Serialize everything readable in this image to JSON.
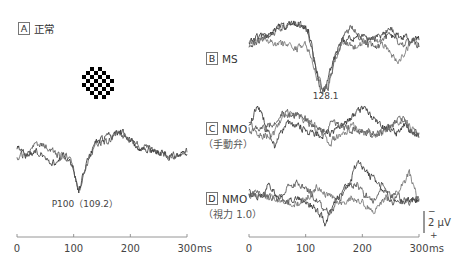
{
  "figure": {
    "panels": {
      "A": {
        "letter": "A",
        "title": "正常"
      },
      "B": {
        "letter": "B",
        "title": "MS"
      },
      "C": {
        "letter": "C",
        "title": "NMO",
        "subtitle": "（手動弁）"
      },
      "D": {
        "letter": "D",
        "title": "NMO",
        "subtitle": "（視力 1.0）"
      }
    },
    "stimulus": {
      "icon": "checkerboard-icon"
    },
    "scale_bar": {
      "label": "2 μV",
      "top_sign": "−",
      "bottom_sign": "+",
      "amplitude_uv": 2,
      "polarity": "negative-up"
    }
  },
  "chart_data": [
    {
      "panel": "A",
      "type": "line",
      "title": "正常",
      "xunit": "ms",
      "xlim": [
        0,
        300
      ],
      "xticks": [
        0,
        100,
        200,
        300
      ],
      "yunit": "μV",
      "annotations": [
        {
          "text": "P100（109.2）",
          "x_ms": 109.2
        }
      ],
      "series": [
        {
          "name": "trace 1",
          "points": [
            [
              0,
              -0.4
            ],
            [
              15,
              0.3
            ],
            [
              30,
              0.0
            ],
            [
              50,
              0.4
            ],
            [
              68,
              1.2
            ],
            [
              80,
              0.3
            ],
            [
              92,
              0.4
            ],
            [
              100,
              1.8
            ],
            [
              109,
              3.9
            ],
            [
              122,
              1.2
            ],
            [
              138,
              -0.9
            ],
            [
              160,
              -1.4
            ],
            [
              183,
              -1.9
            ],
            [
              198,
              -1.4
            ],
            [
              212,
              -0.4
            ],
            [
              232,
              -0.3
            ],
            [
              258,
              0.1
            ],
            [
              280,
              0.5
            ],
            [
              300,
              0.2
            ]
          ]
        },
        {
          "name": "trace 2",
          "points": [
            [
              0,
              0.5
            ],
            [
              15,
              0.2
            ],
            [
              30,
              -0.4
            ],
            [
              44,
              -0.8
            ],
            [
              60,
              -0.1
            ],
            [
              76,
              0.3
            ],
            [
              92,
              0.3
            ],
            [
              100,
              1.7
            ],
            [
              110,
              3.8
            ],
            [
              123,
              1.1
            ],
            [
              140,
              -0.8
            ],
            [
              162,
              -1.1
            ],
            [
              180,
              -1.8
            ],
            [
              200,
              -1.2
            ],
            [
              220,
              -0.5
            ],
            [
              240,
              -0.2
            ],
            [
              262,
              0.4
            ],
            [
              282,
              0.2
            ],
            [
              300,
              0.0
            ]
          ]
        }
      ]
    },
    {
      "panel": "B",
      "type": "line",
      "title": "MS",
      "xunit": "ms",
      "xlim": [
        0,
        300
      ],
      "xticks": [
        0,
        100,
        200,
        300
      ],
      "yunit": "μV",
      "annotations": [
        {
          "text": "128.1",
          "x_ms": 128.1
        }
      ],
      "series": [
        {
          "name": "trace 1",
          "points": [
            [
              0,
              0.0
            ],
            [
              25,
              -0.6
            ],
            [
              50,
              -1.4
            ],
            [
              70,
              -1.6
            ],
            [
              90,
              -1.7
            ],
            [
              105,
              -1.2
            ],
            [
              115,
              1.5
            ],
            [
              125,
              4.4
            ],
            [
              135,
              4.6
            ],
            [
              145,
              2.5
            ],
            [
              160,
              0.2
            ],
            [
              175,
              -0.3
            ],
            [
              195,
              -0.5
            ],
            [
              215,
              -0.2
            ],
            [
              235,
              -0.5
            ],
            [
              255,
              -0.6
            ],
            [
              275,
              -0.5
            ],
            [
              290,
              -0.2
            ],
            [
              300,
              -0.3
            ]
          ]
        },
        {
          "name": "trace 2",
          "points": [
            [
              0,
              0.3
            ],
            [
              25,
              -0.2
            ],
            [
              50,
              -1.0
            ],
            [
              70,
              -1.8
            ],
            [
              90,
              -1.8
            ],
            [
              105,
              -0.8
            ],
            [
              118,
              2.5
            ],
            [
              130,
              4.5
            ],
            [
              140,
              4.2
            ],
            [
              150,
              2.0
            ],
            [
              165,
              -0.2
            ],
            [
              180,
              -1.5
            ],
            [
              195,
              -0.6
            ],
            [
              210,
              0.2
            ],
            [
              230,
              0.5
            ],
            [
              248,
              -1.6
            ],
            [
              268,
              0.4
            ],
            [
              290,
              0.0
            ],
            [
              300,
              0.3
            ]
          ]
        },
        {
          "name": "trace 3",
          "points": [
            [
              0,
              0.2
            ],
            [
              25,
              -0.3
            ],
            [
              45,
              0.2
            ],
            [
              65,
              0.3
            ],
            [
              85,
              0.6
            ],
            [
              100,
              0.2
            ],
            [
              112,
              1.8
            ],
            [
              128,
              4.6
            ],
            [
              138,
              4.4
            ],
            [
              150,
              1.8
            ],
            [
              165,
              0.0
            ],
            [
              185,
              0.5
            ],
            [
              205,
              0.0
            ],
            [
              225,
              -0.4
            ],
            [
              245,
              0.6
            ],
            [
              262,
              2.0
            ],
            [
              276,
              1.0
            ],
            [
              290,
              -0.3
            ],
            [
              300,
              0.5
            ]
          ]
        }
      ]
    },
    {
      "panel": "C",
      "type": "line",
      "title": "NMO",
      "subtitle": "（手動弁）",
      "xunit": "ms",
      "xlim": [
        0,
        300
      ],
      "xticks": [
        0,
        100,
        200,
        300
      ],
      "yunit": "μV",
      "annotations": [],
      "series": [
        {
          "name": "trace 1",
          "points": [
            [
              0,
              0.0
            ],
            [
              8,
              -1.2
            ],
            [
              15,
              -2.4
            ],
            [
              25,
              -1.0
            ],
            [
              35,
              0.6
            ],
            [
              45,
              1.8
            ],
            [
              55,
              0.4
            ],
            [
              70,
              -0.5
            ],
            [
              90,
              -0.2
            ],
            [
              110,
              0.5
            ],
            [
              130,
              0.8
            ],
            [
              150,
              0.3
            ],
            [
              170,
              -0.4
            ],
            [
              190,
              -1.6
            ],
            [
              205,
              -1.8
            ],
            [
              220,
              -0.9
            ],
            [
              240,
              0.0
            ],
            [
              260,
              0.5
            ],
            [
              275,
              -0.3
            ],
            [
              290,
              0.6
            ],
            [
              300,
              0.8
            ]
          ]
        },
        {
          "name": "trace 2",
          "points": [
            [
              0,
              -0.3
            ],
            [
              15,
              0.2
            ],
            [
              30,
              0.0
            ],
            [
              45,
              -0.6
            ],
            [
              60,
              -1.5
            ],
            [
              75,
              -1.3
            ],
            [
              95,
              -1.2
            ],
            [
              110,
              -0.1
            ],
            [
              130,
              0.3
            ],
            [
              150,
              -0.5
            ],
            [
              170,
              0.0
            ],
            [
              190,
              0.2
            ],
            [
              210,
              0.4
            ],
            [
              230,
              0.6
            ],
            [
              250,
              0.0
            ],
            [
              270,
              -1.0
            ],
            [
              285,
              0.2
            ],
            [
              300,
              0.5
            ]
          ]
        },
        {
          "name": "trace 3",
          "points": [
            [
              0,
              0.2
            ],
            [
              15,
              0.6
            ],
            [
              30,
              0.8
            ],
            [
              45,
              0.5
            ],
            [
              60,
              -1.1
            ],
            [
              80,
              -1.2
            ],
            [
              100,
              -0.8
            ],
            [
              120,
              -0.2
            ],
            [
              140,
              1.4
            ],
            [
              160,
              0.8
            ],
            [
              180,
              -0.2
            ],
            [
              200,
              0.2
            ],
            [
              220,
              0.7
            ],
            [
              240,
              0.3
            ],
            [
              260,
              -0.6
            ],
            [
              275,
              -0.8
            ],
            [
              290,
              0.3
            ],
            [
              300,
              0.9
            ]
          ]
        }
      ]
    },
    {
      "panel": "D",
      "type": "line",
      "title": "NMO",
      "subtitle": "（視力 1.0）",
      "xunit": "ms",
      "xlim": [
        0,
        300
      ],
      "xticks": [
        0,
        100,
        200,
        300
      ],
      "yunit": "μV",
      "annotations": [],
      "series": [
        {
          "name": "trace 1",
          "points": [
            [
              0,
              0.0
            ],
            [
              20,
              0.5
            ],
            [
              35,
              -0.8
            ],
            [
              50,
              0.4
            ],
            [
              70,
              0.8
            ],
            [
              90,
              0.5
            ],
            [
              110,
              1.2
            ],
            [
              125,
              2.0
            ],
            [
              135,
              2.9
            ],
            [
              150,
              1.0
            ],
            [
              170,
              -0.8
            ],
            [
              180,
              -1.2
            ],
            [
              190,
              -2.9
            ],
            [
              210,
              -1.8
            ],
            [
              230,
              -0.9
            ],
            [
              250,
              0.8
            ],
            [
              270,
              1.0
            ],
            [
              285,
              0.5
            ],
            [
              300,
              0.8
            ]
          ]
        },
        {
          "name": "trace 2",
          "points": [
            [
              0,
              0.2
            ],
            [
              20,
              0.1
            ],
            [
              35,
              0.4
            ],
            [
              55,
              0.6
            ],
            [
              70,
              -0.6
            ],
            [
              85,
              -1.0
            ],
            [
              100,
              -0.7
            ],
            [
              115,
              0.5
            ],
            [
              130,
              1.4
            ],
            [
              145,
              1.8
            ],
            [
              160,
              0.6
            ],
            [
              175,
              -0.7
            ],
            [
              190,
              -0.9
            ],
            [
              205,
              0.3
            ],
            [
              220,
              0.8
            ],
            [
              235,
              -0.8
            ],
            [
              250,
              0.2
            ],
            [
              270,
              0.6
            ],
            [
              285,
              0.9
            ],
            [
              300,
              0.5
            ]
          ]
        },
        {
          "name": "trace 3",
          "points": [
            [
              0,
              0.3
            ],
            [
              20,
              0.0
            ],
            [
              40,
              0.6
            ],
            [
              60,
              0.9
            ],
            [
              80,
              1.0
            ],
            [
              100,
              0.6
            ],
            [
              120,
              -0.6
            ],
            [
              140,
              0.3
            ],
            [
              160,
              0.9
            ],
            [
              180,
              0.5
            ],
            [
              200,
              1.0
            ],
            [
              220,
              1.6
            ],
            [
              240,
              0.6
            ],
            [
              255,
              0.3
            ],
            [
              270,
              -0.8
            ],
            [
              283,
              -1.8
            ],
            [
              294,
              0.0
            ],
            [
              300,
              0.5
            ]
          ]
        }
      ]
    }
  ]
}
